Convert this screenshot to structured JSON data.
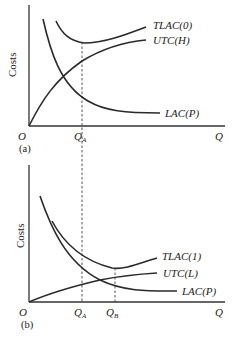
{
  "panels": {
    "a": {
      "tag": "(a)",
      "y_axis_label": "Costs",
      "origin_label": "O",
      "x_axis_label": "Q",
      "qa_label": "Q",
      "qa_sub": "A",
      "curves": {
        "tlac": "TLAC(0)",
        "utc": "UTC(H)",
        "lac": "LAC(P)"
      }
    },
    "b": {
      "tag": "(b)",
      "y_axis_label": "Costs",
      "origin_label": "O",
      "x_axis_label": "Q",
      "qa_label": "Q",
      "qa_sub": "A",
      "qb_label": "Q",
      "qb_sub": "B",
      "curves": {
        "tlac": "TLAC(1)",
        "utc": "UTC(L)",
        "lac": "LAC(P)"
      }
    }
  }
}
